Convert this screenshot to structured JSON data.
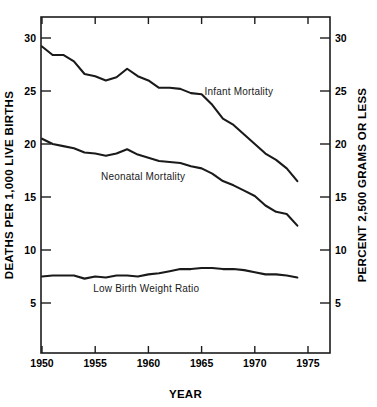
{
  "chart_data": {
    "type": "line",
    "title": "",
    "xlabel": "YEAR",
    "ylabel": "DEATHS PER 1,000 LIVE BIRTHS",
    "ylabel_right": "PERCENT 2,500 GRAMS OR LESS",
    "xlim": [
      1949,
      1976.2
    ],
    "ylim": [
      0,
      31.5
    ],
    "xticks": [
      1950,
      1955,
      1960,
      1965,
      1970,
      1975
    ],
    "xticklabels": [
      "1950",
      "1955",
      "1960",
      "1965",
      "1970",
      "1975"
    ],
    "yticks": [
      5,
      10,
      15,
      20,
      25,
      30
    ],
    "yticklabels": [
      "5",
      "10",
      "15",
      "20",
      "25",
      "30"
    ],
    "yticks_right": [
      5,
      10,
      15,
      20,
      25,
      30
    ],
    "yticklabels_right": [
      "5",
      "10",
      "15",
      "20",
      "25",
      "30"
    ],
    "grid": false,
    "legend": "inline-annotations",
    "x": [
      1950,
      1951,
      1952,
      1953,
      1954,
      1955,
      1956,
      1957,
      1958,
      1959,
      1960,
      1961,
      1962,
      1963,
      1964,
      1965,
      1966,
      1967,
      1968,
      1969,
      1970,
      1971,
      1972,
      1973,
      1974
    ],
    "series": [
      {
        "name": "Infant Mortality",
        "axis": "left",
        "values": [
          29.2,
          28.4,
          28.4,
          27.8,
          26.6,
          26.4,
          26.0,
          26.3,
          27.1,
          26.4,
          26.0,
          25.3,
          25.3,
          25.2,
          24.8,
          24.7,
          23.7,
          22.4,
          21.8,
          20.9,
          20.0,
          19.1,
          18.5,
          17.7,
          16.5
        ]
      },
      {
        "name": "Neonatal Mortality",
        "axis": "left",
        "values": [
          20.5,
          20.0,
          19.8,
          19.6,
          19.2,
          19.1,
          18.9,
          19.1,
          19.5,
          19.0,
          18.7,
          18.4,
          18.3,
          18.2,
          17.9,
          17.7,
          17.2,
          16.5,
          16.1,
          15.6,
          15.1,
          14.2,
          13.6,
          13.4,
          12.3
        ]
      },
      {
        "name": "Low Birth Weight Ratio",
        "axis": "right",
        "values": [
          7.5,
          7.6,
          7.6,
          7.6,
          7.3,
          7.5,
          7.4,
          7.6,
          7.6,
          7.5,
          7.7,
          7.8,
          8.0,
          8.2,
          8.2,
          8.3,
          8.3,
          8.2,
          8.2,
          8.1,
          7.9,
          7.7,
          7.7,
          7.6,
          7.4
        ]
      }
    ],
    "annotations": [
      {
        "text": "Infant Mortality",
        "x": 1968.5,
        "y": 24.6
      },
      {
        "text": "Neonatal Mortality",
        "x": 1959.5,
        "y": 16.6
      },
      {
        "text": "Low Birth Weight Ratio",
        "x": 1959.8,
        "y": 6.0
      }
    ]
  },
  "colors": {
    "ink": "#1a1a1a",
    "background": "#ffffff"
  }
}
